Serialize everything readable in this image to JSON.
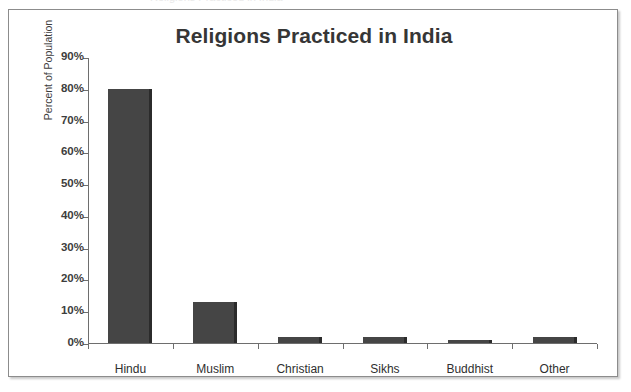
{
  "page": {
    "clipped_header_text": "Religions Practiced in India"
  },
  "chart_data": {
    "type": "bar",
    "title": "Religions Practiced in India",
    "xlabel": "",
    "ylabel": "Percent of Population",
    "categories": [
      "Hindu",
      "Muslim",
      "Christian",
      "Sikhs",
      "Buddhist",
      "Other"
    ],
    "values": [
      80,
      13,
      2,
      2,
      1,
      2
    ],
    "ylim": [
      0,
      90
    ],
    "ytick_labels": [
      "0%",
      "10%",
      "20%",
      "30%",
      "40%",
      "50%",
      "60%",
      "70%",
      "80%",
      "90%"
    ],
    "ytick_values": [
      0,
      10,
      20,
      30,
      40,
      50,
      60,
      70,
      80,
      90
    ],
    "grid": false,
    "legend": false,
    "bar_color": "#454545",
    "bar_edge_color": "#2b2b2b",
    "axis_color": "#6e6e6e",
    "title_color": "#363636",
    "background_color": "#ffffff",
    "border_color": "#8c8c8c"
  }
}
